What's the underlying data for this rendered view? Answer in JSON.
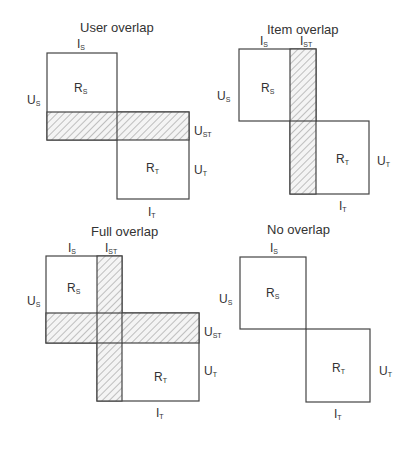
{
  "panels": [
    {
      "id": "user-overlap",
      "title": "User overlap",
      "labels": {
        "is": "I",
        "is_sub": "S",
        "us": "U",
        "us_sub": "S",
        "rs": "R",
        "rs_sub": "S",
        "ust": "U",
        "ust_sub": "ST",
        "ut": "U",
        "ut_sub": "T",
        "rt": "R",
        "rt_sub": "T",
        "it": "I",
        "it_sub": "T"
      }
    },
    {
      "id": "item-overlap",
      "title": "Item overlap",
      "labels": {
        "is": "I",
        "is_sub": "S",
        "ist": "I",
        "ist_sub": "ST",
        "us": "U",
        "us_sub": "S",
        "rs": "R",
        "rs_sub": "S",
        "ut": "U",
        "ut_sub": "T",
        "rt": "R",
        "rt_sub": "T",
        "it": "I",
        "it_sub": "T"
      }
    },
    {
      "id": "full-overlap",
      "title": "Full overlap",
      "labels": {
        "is": "I",
        "is_sub": "S",
        "ist": "I",
        "ist_sub": "ST",
        "us": "U",
        "us_sub": "S",
        "rs": "R",
        "rs_sub": "S",
        "ust": "U",
        "ust_sub": "ST",
        "ut": "U",
        "ut_sub": "T",
        "rt": "R",
        "rt_sub": "T",
        "it": "I",
        "it_sub": "T"
      }
    },
    {
      "id": "no-overlap",
      "title": "No overlap",
      "labels": {
        "is": "I",
        "is_sub": "S",
        "us": "U",
        "us_sub": "S",
        "rs": "R",
        "rs_sub": "S",
        "ut": "U",
        "ut_sub": "T",
        "rt": "R",
        "rt_sub": "T",
        "it": "I",
        "it_sub": "T"
      }
    }
  ],
  "colors": {
    "stroke": "#444444",
    "hatch": "#888888",
    "background": "#ffffff"
  }
}
